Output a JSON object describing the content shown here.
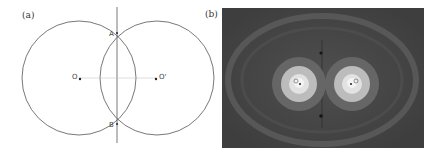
{
  "panels": [
    {
      "label": "(a)",
      "type": "geometric-construction",
      "points": {
        "A": "A",
        "B": "B",
        "O": "O",
        "O_prime": "O'"
      }
    },
    {
      "label": "(b)",
      "type": "field-intensity-image",
      "colors": {
        "background": "#4a4a4a",
        "outer_ring": "#5c5c5c",
        "mid_ring": "#8a8a8a",
        "inner_ring": "#bdbdbd",
        "core": "#ececec"
      }
    }
  ]
}
